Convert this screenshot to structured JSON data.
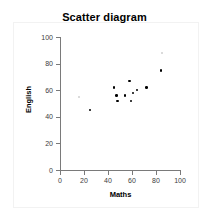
{
  "chart_data": {
    "type": "scatter",
    "title": "Scatter diagram",
    "xlabel": "Maths",
    "ylabel": "English",
    "xlim": [
      0,
      100
    ],
    "ylim": [
      0,
      100
    ],
    "xticks": [
      0,
      20,
      40,
      60,
      80,
      100
    ],
    "yticks": [
      0,
      20,
      40,
      60,
      80,
      100
    ],
    "grid": false,
    "legend": false,
    "marker_color": "#000000",
    "faint_marker_color": "#cfcfcf",
    "points": [
      {
        "x": 16,
        "y": 55,
        "faint": true
      },
      {
        "x": 25,
        "y": 45,
        "faint": false
      },
      {
        "x": 45,
        "y": 62,
        "faint": false
      },
      {
        "x": 47,
        "y": 56,
        "faint": false
      },
      {
        "x": 48,
        "y": 52,
        "faint": false
      },
      {
        "x": 54,
        "y": 56,
        "faint": false
      },
      {
        "x": 58,
        "y": 67,
        "faint": false
      },
      {
        "x": 59,
        "y": 52,
        "faint": false
      },
      {
        "x": 61,
        "y": 58,
        "faint": false
      },
      {
        "x": 64,
        "y": 60,
        "faint": false
      },
      {
        "x": 72,
        "y": 62,
        "faint": false
      },
      {
        "x": 84,
        "y": 75,
        "faint": false
      },
      {
        "x": 85,
        "y": 88,
        "faint": true
      }
    ]
  },
  "axis_labels": {
    "x_tick_texts": [
      "0",
      "20",
      "40",
      "60",
      "80",
      "100"
    ],
    "y_tick_texts": [
      "0",
      "20",
      "40",
      "60",
      "80",
      "100"
    ]
  }
}
